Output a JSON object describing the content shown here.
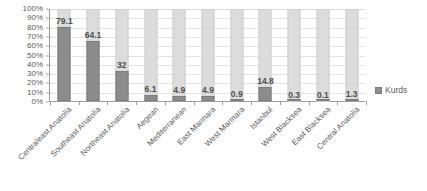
{
  "chart_data": {
    "type": "bar",
    "subtype": "100% stacked column",
    "title": "",
    "subtitle": "",
    "xlabel": "",
    "ylabel": "",
    "ylim": [
      0,
      100
    ],
    "grid": true,
    "legend_position": "right",
    "categories": [
      "Centraleast Anatolia",
      "Southeast Anatolia",
      "Northeast Anatolia",
      "Aegean",
      "Mediterranean",
      "East Marmara",
      "West Marmara",
      "Istanbul",
      "West Blacksea",
      "East Blacksea",
      "Central Anatolia"
    ],
    "series": [
      {
        "name": "Kurds",
        "color": "#8c8c8c",
        "values": [
          79.1,
          64.1,
          32,
          6.1,
          4.9,
          4.9,
          0.9,
          14.8,
          0.3,
          0.1,
          1.3
        ]
      },
      {
        "name": "",
        "color": "#dcdcdc",
        "values": [
          20.9,
          35.9,
          68,
          93.9,
          95.1,
          95.1,
          99.1,
          85.2,
          99.7,
          99.9,
          98.7
        ]
      }
    ],
    "data_labels": [
      "79.1",
      "64.1",
      "32",
      "6.1",
      "4.9",
      "4.9",
      "0.9",
      "14.8",
      "0.3",
      "0.1",
      "1.3"
    ],
    "y_ticks": [
      "100%",
      "90%",
      "80%",
      "70%",
      "60%",
      "50%",
      "40%",
      "30%",
      "20%",
      "10%",
      "0%"
    ],
    "y_tick_values": [
      100,
      90,
      80,
      70,
      60,
      50,
      40,
      30,
      20,
      10,
      0
    ]
  },
  "legend": {
    "entries": [
      {
        "label": "Kurds",
        "color": "#8c8c8c"
      }
    ]
  }
}
